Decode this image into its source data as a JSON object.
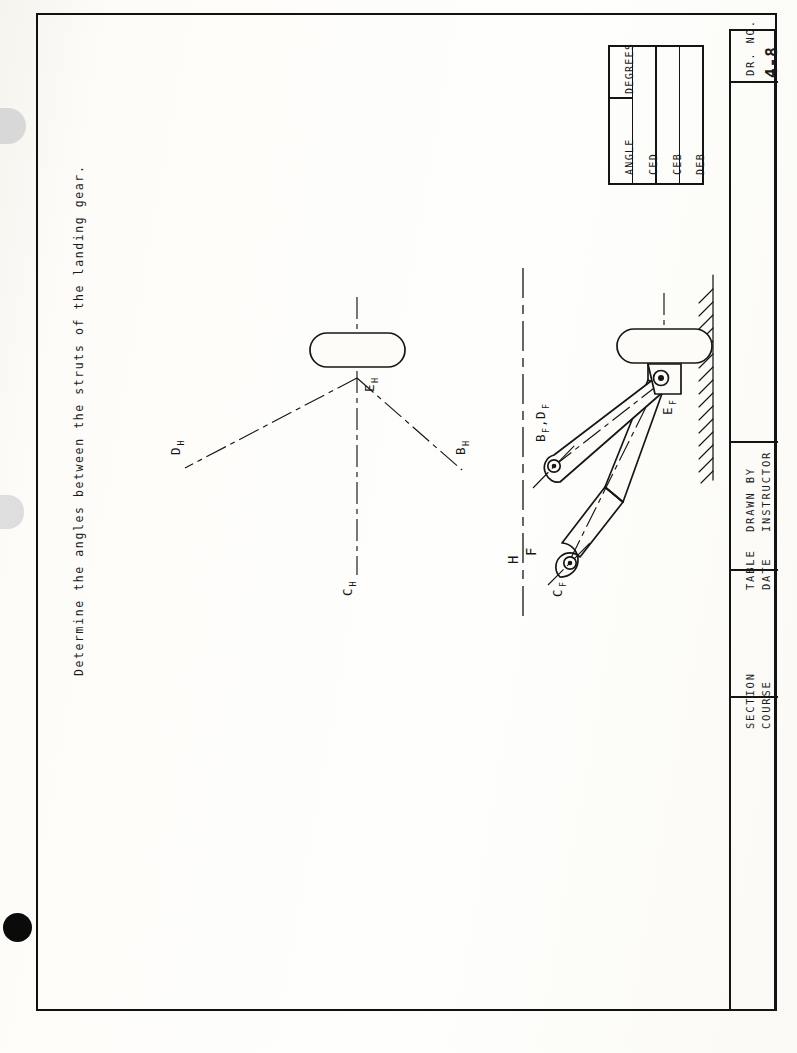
{
  "sheet": {
    "prompt": "Determine the angles between the struts of the landing gear."
  },
  "angle_table": {
    "headers": [
      "ANGLE",
      "DEGREES"
    ],
    "rows": [
      {
        "angle": "CED",
        "degrees": ""
      },
      {
        "angle": "CEB",
        "degrees": ""
      },
      {
        "angle": "DEB",
        "degrees": ""
      }
    ]
  },
  "title_block": {
    "cells": [
      {
        "name": "drawing-number",
        "line1": "DR. NO.",
        "line2": "4-8"
      },
      {
        "name": "drawn-by",
        "line1": "DRAWN BY",
        "line2": "INSTRUCTOR"
      },
      {
        "name": "table-date",
        "line1": "TABLE",
        "line2": "DATE"
      },
      {
        "name": "section-course",
        "line1": "SECTION",
        "line2": "COURSE"
      }
    ]
  },
  "views": {
    "top_view": {
      "name": "H",
      "labels": {
        "apex": "E",
        "apex_sub": "H",
        "left": "D",
        "left_sub": "H",
        "right": "B",
        "right_sub": "H",
        "down": "C",
        "down_sub": "H"
      }
    },
    "front_view": {
      "name": "F",
      "fold_line": {
        "upper": "H",
        "lower": "F"
      },
      "labels": {
        "pivot": "E",
        "pivot_sub": "F",
        "strut_bd": "B",
        "strut_bd_sub": "F",
        "strut_bd_2": ",D",
        "strut_bd_2_sub": "F",
        "strut_c": "C",
        "strut_c_sub": "F"
      }
    }
  },
  "colors": {
    "ink": "#161616",
    "paper": "#fcfbf7"
  }
}
